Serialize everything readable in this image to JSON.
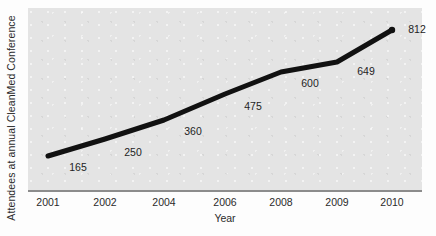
{
  "chart_data": {
    "type": "line",
    "title": "",
    "xlabel": "Year",
    "ylabel": "Attendees at annual CleanMed Conference",
    "categories": [
      "2001",
      "2002",
      "2004",
      "2006",
      "2008",
      "2009",
      "2010"
    ],
    "values": [
      165,
      250,
      360,
      475,
      600,
      649,
      812
    ],
    "point_labels": [
      "165",
      "250",
      "360",
      "475",
      "600",
      "649",
      "812"
    ],
    "series": [
      {
        "name": "Attendees",
        "values": [
          165,
          250,
          360,
          475,
          600,
          649,
          812
        ],
        "color": "#111111"
      }
    ],
    "xlim": [
      2001,
      2010
    ],
    "ylim": [
      0,
      900
    ],
    "grid": false,
    "legend": false,
    "legend_position": "none",
    "plot_background_color": "#e4e4e4",
    "line_color": "#111111",
    "line_width_px": 5,
    "axis_line_color": "#8c8c8c",
    "points": [
      {
        "category": "2001",
        "value": 165,
        "label": "165",
        "px": 48,
        "py": 156,
        "label_x": 78,
        "label_y": 167
      },
      {
        "category": "2002",
        "value": 250,
        "label": "250",
        "px": 105,
        "py": 139,
        "label_x": 133,
        "label_y": 152
      },
      {
        "category": "2004",
        "value": 360,
        "label": "360",
        "px": 164,
        "py": 120,
        "label_x": 193,
        "label_y": 131
      },
      {
        "category": "2006",
        "value": 475,
        "label": "475",
        "px": 225,
        "py": 94,
        "label_x": 253,
        "label_y": 106
      },
      {
        "category": "2008",
        "value": 600,
        "label": "600",
        "px": 281,
        "py": 72,
        "label_x": 310,
        "label_y": 83
      },
      {
        "category": "2009",
        "value": 649,
        "label": "649",
        "px": 337,
        "py": 62,
        "label_x": 366,
        "label_y": 71
      },
      {
        "category": "2010",
        "value": 812,
        "label": "812",
        "px": 392,
        "py": 30,
        "label_x": 417,
        "label_y": 29
      }
    ],
    "tick_positions_px": [
      48,
      105,
      164,
      225,
      281,
      337,
      392
    ]
  }
}
